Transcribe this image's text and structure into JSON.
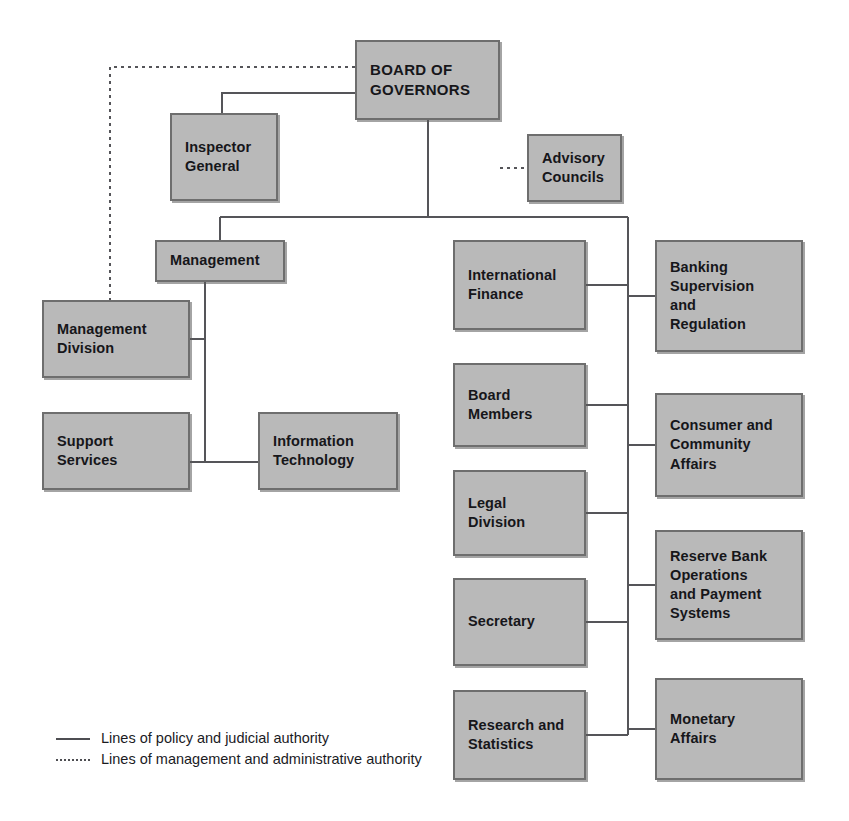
{
  "chart": {
    "type": "org-chart",
    "canvas": {
      "width": 849,
      "height": 821
    },
    "colors": {
      "box_fill": "#b9b9b9",
      "box_border": "#6e6e6e",
      "line": "#555559",
      "text": "#16161a",
      "background": "#ffffff"
    }
  },
  "nodes": {
    "board_of_governors": {
      "label": "BOARD OF\nGOVERNORS",
      "x": 355,
      "y": 40,
      "w": 145,
      "h": 80
    },
    "inspector_general": {
      "label": "Inspector\nGeneral",
      "x": 170,
      "y": 113,
      "w": 108,
      "h": 88
    },
    "advisory_councils": {
      "label": "Advisory\nCouncils",
      "x": 527,
      "y": 134,
      "w": 95,
      "h": 68
    },
    "management": {
      "label": "Management",
      "x": 155,
      "y": 240,
      "w": 130,
      "h": 42
    },
    "management_division": {
      "label": "Management\nDivision",
      "x": 42,
      "y": 300,
      "w": 148,
      "h": 78
    },
    "support_services": {
      "label": "Support\nServices",
      "x": 42,
      "y": 412,
      "w": 148,
      "h": 78
    },
    "information_technology": {
      "label": "Information\nTechnology",
      "x": 258,
      "y": 412,
      "w": 140,
      "h": 78
    },
    "international_finance": {
      "label": "International\nFinance",
      "x": 453,
      "y": 240,
      "w": 133,
      "h": 90
    },
    "board_members": {
      "label": "Board\nMembers",
      "x": 453,
      "y": 363,
      "w": 133,
      "h": 84
    },
    "legal_division": {
      "label": "Legal\nDivision",
      "x": 453,
      "y": 470,
      "w": 133,
      "h": 86
    },
    "secretary": {
      "label": "Secretary",
      "x": 453,
      "y": 578,
      "w": 133,
      "h": 88
    },
    "research_and_statistics": {
      "label": "Research and\nStatistics",
      "x": 453,
      "y": 690,
      "w": 133,
      "h": 90
    },
    "banking_supervision_and_regulation": {
      "label": "Banking\nSupervision\nand\nRegulation",
      "x": 655,
      "y": 240,
      "w": 148,
      "h": 112
    },
    "consumer_and_community_affairs": {
      "label": "Consumer and\nCommunity\nAffairs",
      "x": 655,
      "y": 393,
      "w": 148,
      "h": 104
    },
    "reserve_bank_operations": {
      "label": "Reserve Bank\nOperations\nand Payment\nSystems",
      "x": 655,
      "y": 530,
      "w": 148,
      "h": 110
    },
    "monetary_affairs": {
      "label": "Monetary\nAffairs",
      "x": 655,
      "y": 678,
      "w": 148,
      "h": 102
    }
  },
  "legend": {
    "items": [
      {
        "style": "solid",
        "label": "Lines of policy and judicial authority"
      },
      {
        "style": "dashed",
        "label": "Lines of management and administrative authority"
      }
    ]
  }
}
